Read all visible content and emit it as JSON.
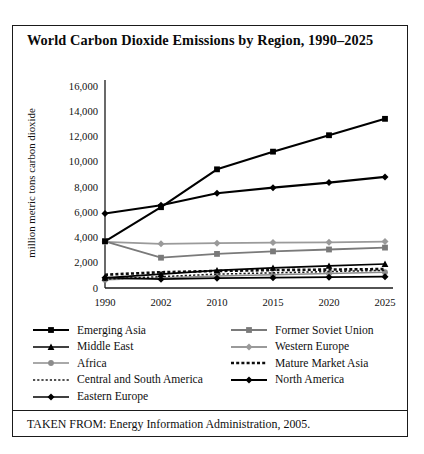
{
  "figure": {
    "title": "World Carbon Dioxide Emissions by Region, 1990–2025",
    "source_note": "TAKEN FROM: Energy Information Administration, 2005."
  },
  "chart_data": {
    "type": "line",
    "title": "World Carbon Dioxide Emissions by Region, 1990–2025",
    "xlabel": "",
    "ylabel": "million metric tons carbon dioxide",
    "categories": [
      "1990",
      "2002",
      "2010",
      "2015",
      "2020",
      "2025"
    ],
    "ylim": [
      0,
      16000
    ],
    "ytick_step": 2000,
    "yticks": [
      "0",
      "2,000",
      "4,000",
      "6,000",
      "8,000",
      "10,000",
      "12,000",
      "14,000",
      "16,000"
    ],
    "grid": false,
    "legend_position": "below-plot",
    "series": [
      {
        "name": "Emerging Asia",
        "values": [
          3700,
          6400,
          9400,
          10800,
          12100,
          13400
        ],
        "color": "#000000",
        "marker": "square",
        "line": "solid",
        "width": 2.1
      },
      {
        "name": "Middle East",
        "values": [
          800,
          1100,
          1400,
          1600,
          1750,
          1900
        ],
        "color": "#000000",
        "marker": "triangle",
        "line": "solid",
        "width": 1.7
      },
      {
        "name": "Africa",
        "values": [
          650,
          800,
          950,
          1050,
          1150,
          1250
        ],
        "color": "#8c8c8c",
        "marker": "circle",
        "line": "solid",
        "width": 1.5
      },
      {
        "name": "Central and South America",
        "values": [
          700,
          900,
          1100,
          1200,
          1300,
          1400
        ],
        "color": "#1a1a1a",
        "marker": "none",
        "line": "dotted-thin",
        "width": 1.5
      },
      {
        "name": "Eastern Europe",
        "values": [
          820,
          700,
          780,
          820,
          860,
          900
        ],
        "color": "#000000",
        "marker": "diamond",
        "line": "solid",
        "width": 1.6
      },
      {
        "name": "Former Soviet Union",
        "values": [
          3700,
          2400,
          2700,
          2900,
          3050,
          3200
        ],
        "color": "#7a7a7a",
        "marker": "square",
        "line": "solid",
        "width": 1.8
      },
      {
        "name": "Western Europe",
        "values": [
          3650,
          3500,
          3550,
          3600,
          3620,
          3680
        ],
        "color": "#9a9a9a",
        "marker": "diamond",
        "line": "solid",
        "width": 1.8
      },
      {
        "name": "Mature Market Asia",
        "values": [
          1050,
          1250,
          1350,
          1420,
          1460,
          1500
        ],
        "color": "#0d0d0d",
        "marker": "none",
        "line": "dotted-thick",
        "width": 2.6
      },
      {
        "name": "North America",
        "values": [
          5900,
          6550,
          7500,
          7950,
          8350,
          8800
        ],
        "color": "#000000",
        "marker": "diamond",
        "line": "solid",
        "width": 2.1
      }
    ]
  },
  "legend": {
    "left_column": [
      {
        "label": "Emerging Asia",
        "icon": "line-swatch-square-marker"
      },
      {
        "label": "Middle East",
        "icon": "line-swatch-triangle-marker"
      },
      {
        "label": "Africa",
        "icon": "line-swatch-gray-circle-marker"
      },
      {
        "label": "Central and South America",
        "icon": "line-swatch-dotted-thin"
      },
      {
        "label": "Eastern Europe",
        "icon": "line-swatch-diamond-marker"
      }
    ],
    "right_column": [
      {
        "label": "Former Soviet Union",
        "icon": "line-swatch-gray-square-marker"
      },
      {
        "label": "Western Europe",
        "icon": "line-swatch-gray-diamond-marker"
      },
      {
        "label": "Mature Market Asia",
        "icon": "line-swatch-dotted-thick"
      },
      {
        "label": "North America",
        "icon": "line-swatch-bold-diamond-marker"
      }
    ]
  }
}
